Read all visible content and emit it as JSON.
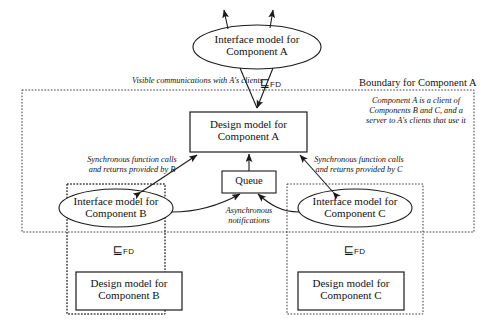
{
  "diagram": {
    "colors": {
      "stroke": "#1a1a1a",
      "dashed": "#444444",
      "background": "#ffffff"
    },
    "nodes": {
      "interface_a": {
        "line1": "Interface model for",
        "line2": "Component A",
        "shape": "ellipse"
      },
      "design_a": {
        "line1": "Design model for",
        "line2": "Component A",
        "shape": "rect"
      },
      "interface_b": {
        "line1": "Interface model for",
        "line2": "Component B",
        "shape": "ellipse"
      },
      "interface_c": {
        "line1": "Interface model for",
        "line2": "Component C",
        "shape": "ellipse"
      },
      "design_b": {
        "line1": "Design model for",
        "line2": "Component B",
        "shape": "rect"
      },
      "design_c": {
        "line1": "Design model for",
        "line2": "Component C",
        "shape": "rect"
      },
      "queue": {
        "label": "Queue",
        "shape": "rect"
      }
    },
    "refinements": {
      "symbol": "⊑",
      "subscript": "FD",
      "a": {
        "symbol": "⊑",
        "subscript": "FD"
      },
      "b": {
        "symbol": "⊑",
        "subscript": "FD"
      },
      "c": {
        "symbol": "⊑",
        "subscript": "FD"
      }
    },
    "annotations": {
      "visible_comms": "Visible communications with A's clients",
      "boundary_a": "Boundary for Component A",
      "note_a_line1": "Component A is a client of",
      "note_a_line2": "Components B and C, and a",
      "note_a_line3": "server to A's clients that use it",
      "sync_b_line1": "Synchronous function calls",
      "sync_b_line2": "and returns provided by B",
      "sync_c_line1": "Synchronous function calls",
      "sync_c_line2": "and returns provided by C",
      "async_line1": "Asynchronous",
      "async_line2": "notifications"
    }
  }
}
